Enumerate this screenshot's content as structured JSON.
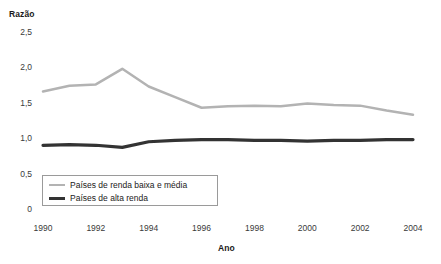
{
  "chart_data": {
    "type": "line",
    "title": "",
    "xlabel": "Ano",
    "ylabel": "Razão",
    "xlim": [
      1990,
      2004
    ],
    "ylim": [
      0,
      2.5
    ],
    "grid": false,
    "legend_position": "bottom-left",
    "x": [
      1990,
      1991,
      1992,
      1993,
      1994,
      1995,
      1996,
      1997,
      1998,
      1999,
      2000,
      2001,
      2002,
      2003,
      2004
    ],
    "y_ticks": [
      "0",
      "0,5",
      "1,0",
      "1,5",
      "2,0",
      "2,5"
    ],
    "y_tick_values": [
      0,
      0.5,
      1.0,
      1.5,
      2.0,
      2.5
    ],
    "x_ticks": [
      "1990",
      "1992",
      "1994",
      "1996",
      "1998",
      "2000",
      "2002",
      "2004"
    ],
    "x_tick_values": [
      1990,
      1992,
      1994,
      1996,
      1998,
      2000,
      2002,
      2004
    ],
    "series": [
      {
        "name": "Países de renda baixa e média",
        "color": "#b3b3b3",
        "width": 2.5,
        "values": [
          1.66,
          1.74,
          1.76,
          1.98,
          1.73,
          1.58,
          1.43,
          1.45,
          1.46,
          1.45,
          1.49,
          1.47,
          1.46,
          1.39,
          1.33
        ]
      },
      {
        "name": "Países de alta renda",
        "color": "#333333",
        "width": 3.2,
        "values": [
          0.9,
          0.91,
          0.9,
          0.87,
          0.95,
          0.97,
          0.98,
          0.98,
          0.97,
          0.97,
          0.96,
          0.97,
          0.97,
          0.98,
          0.98
        ]
      }
    ]
  },
  "axis": {
    "y_title": "Razão",
    "x_title": "Ano"
  },
  "legend": {
    "items": [
      {
        "label": "Países de renda baixa e média"
      },
      {
        "label": "Países de alta renda"
      }
    ]
  }
}
